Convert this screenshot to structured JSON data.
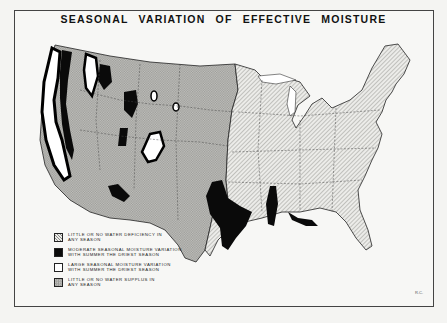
{
  "title": "SEASONAL VARIATION OF EFFECTIVE MOISTURE",
  "legend": {
    "items": [
      {
        "pattern": "diagonal-hatch-light",
        "line1": "LITTLE OR NO WATER DEFICIENCY IN",
        "line2": "ANY SEASON"
      },
      {
        "pattern": "solid-black",
        "line1": "MODERATE SEASONAL MOISTURE VARIATION",
        "line2": "WITH SUMMER THE DRIEST SEASON"
      },
      {
        "pattern": "white",
        "line1": "LARGE SEASONAL MOISTURE VARIATION",
        "line2": "WITH SUMMER THE DRIEST SEASON"
      },
      {
        "pattern": "crosshatch-gray",
        "line1": "LITTLE OR NO WATER SUPPLUS IN",
        "line2": "ANY SEASON"
      }
    ]
  },
  "corner_mark": "R.C.",
  "colors": {
    "frame": "#444444",
    "paper": "#f7f7f5",
    "dry_region": "#b9b9b6",
    "humid_region": "#e2e2df",
    "moderate": "#0a0a0a",
    "large": "#ffffff"
  }
}
